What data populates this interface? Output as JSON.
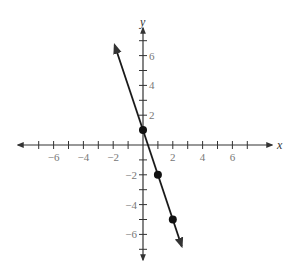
{
  "chart_data": {
    "type": "line",
    "title": "",
    "xlabel": "x",
    "ylabel": "y",
    "xlim": [
      -7,
      7
    ],
    "ylim": [
      -7,
      7
    ],
    "grid": false,
    "x_ticks": [
      -7,
      -6,
      -5,
      -4,
      -3,
      -2,
      -1,
      1,
      2,
      3,
      4,
      5,
      6,
      7
    ],
    "x_tick_labels": [
      "-6",
      "-4",
      "-2",
      "2",
      "4",
      "6"
    ],
    "y_ticks": [
      -7,
      -6,
      -5,
      -4,
      -3,
      -2,
      -1,
      1,
      2,
      3,
      4,
      5,
      6,
      7
    ],
    "y_tick_labels": [
      "6",
      "4",
      "2",
      "-2",
      "-4",
      "-6"
    ],
    "series": [
      {
        "name": "y = -3x + 1",
        "equation": "y = -3x + 1",
        "line_extent_x": [
          -1.9,
          2.6
        ],
        "points": [
          {
            "x": 0,
            "y": 1
          },
          {
            "x": 1,
            "y": -2
          },
          {
            "x": 2,
            "y": -5
          }
        ]
      }
    ]
  },
  "colors": {
    "axis": "#333333",
    "line": "#1a1a1a",
    "tick_label": "#777777"
  }
}
